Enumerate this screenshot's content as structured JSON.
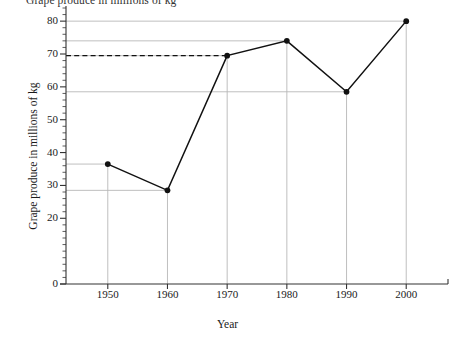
{
  "chart_data": {
    "type": "line",
    "title": "Grape produce in millions of kg",
    "xlabel": "Year",
    "ylabel": "Grape produce in millions of kg",
    "x": [
      1950,
      1960,
      1970,
      1980,
      1990,
      2000
    ],
    "values": [
      36.5,
      28.5,
      69.5,
      74,
      58.5,
      80
    ],
    "categories": [
      "1950",
      "1960",
      "1970",
      "1980",
      "1990",
      "2000"
    ],
    "x_tick_labels": [
      "1950",
      "1960",
      "1970",
      "1980",
      "1990",
      "2000"
    ],
    "y_tick_labels": [
      "0",
      "20",
      "30",
      "40",
      "50",
      "60",
      "70",
      "80"
    ],
    "y_tick_values": [
      0,
      20,
      30,
      40,
      50,
      60,
      70,
      80
    ],
    "ylim": [
      0,
      84
    ],
    "xlim": [
      1943,
      2007
    ],
    "grid": true,
    "legend": "none",
    "marker": "filled-circle",
    "line_color": "#111111",
    "grid_color": "#b8b8b8",
    "annotations": [
      {
        "type": "dashed-reference-line",
        "value": 69.5,
        "from_x": 1943,
        "to_x": 1970,
        "label": ""
      }
    ]
  },
  "axes": {
    "y_title": "Grape produce in millions of kg",
    "x_title": "Year"
  }
}
